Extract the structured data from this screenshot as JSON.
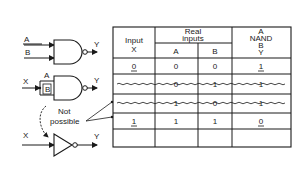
{
  "diagram": {
    "gates": {
      "nand_top": {
        "input_a": "A",
        "input_b": "B",
        "output": "Y"
      },
      "nand_tied": {
        "input_x": "X",
        "input_a": "A",
        "input_b": "B",
        "output": "Y"
      },
      "inverter": {
        "input": "X",
        "output": "Y"
      }
    },
    "annotation": {
      "line1": "Not",
      "line2": "possible"
    }
  },
  "table": {
    "headers": {
      "input_x": [
        "Input",
        "X"
      ],
      "real_inputs": [
        "Real",
        "inputs"
      ],
      "sub_a": "A",
      "sub_b": "B",
      "nand": [
        "A",
        "NAND",
        "B",
        "Y"
      ]
    },
    "rows": [
      {
        "x": "0",
        "a": "0",
        "b": "0",
        "y": "1",
        "struck": false
      },
      {
        "x": "",
        "a": "0",
        "b": "1",
        "y": "1",
        "struck": true
      },
      {
        "x": "",
        "a": "1",
        "b": "0",
        "y": "1",
        "struck": true
      },
      {
        "x": "1",
        "a": "1",
        "b": "1",
        "y": "0",
        "struck": false
      }
    ]
  }
}
